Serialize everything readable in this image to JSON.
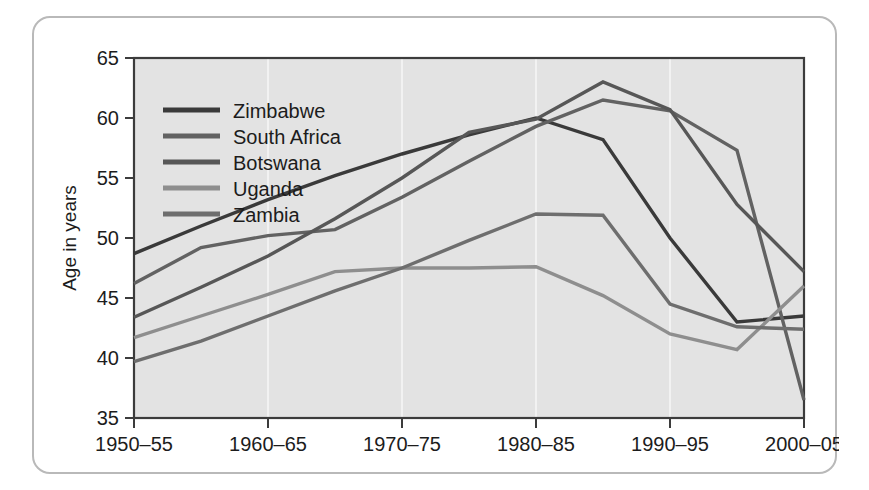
{
  "chart_data": {
    "type": "line",
    "title": "",
    "xlabel": "",
    "ylabel": "Age in years",
    "categories": [
      "1950–55",
      "1955–60",
      "1960–65",
      "1965–70",
      "1970–75",
      "1975–80",
      "1980–85",
      "1985–90",
      "1990–95",
      "1995–2000",
      "2000–05"
    ],
    "tick_labels_x": [
      "1950–55",
      "1960–65",
      "1970–75",
      "1980–85",
      "1990–95",
      "2000–05"
    ],
    "tick_labels_y": [
      "35",
      "40",
      "45",
      "50",
      "55",
      "60",
      "65"
    ],
    "ylim": [
      35,
      65
    ],
    "yticks": [
      35,
      40,
      45,
      50,
      55,
      60,
      65
    ],
    "grid": true,
    "grid_axis": "x",
    "legend_position": "top-left",
    "plot_background": "#e3e3e3",
    "series": [
      {
        "name": "Zimbabwe",
        "color": "#3a3a3a",
        "values": [
          48.7,
          51.0,
          53.2,
          55.2,
          57.0,
          58.6,
          60.0,
          58.2,
          50.0,
          43.0,
          43.5
        ]
      },
      {
        "name": "South Africa",
        "color": "#626262",
        "values": [
          46.2,
          49.2,
          50.2,
          50.7,
          53.4,
          56.4,
          59.3,
          61.5,
          60.6,
          57.3,
          36.5
        ]
      },
      {
        "name": "Botswana",
        "color": "#575757",
        "values": [
          43.4,
          45.9,
          48.5,
          51.6,
          55.0,
          58.8,
          59.9,
          63.0,
          60.7,
          52.8,
          47.2
        ]
      },
      {
        "name": "Uganda",
        "color": "#8e8e8e",
        "values": [
          41.7,
          43.5,
          45.3,
          47.2,
          47.5,
          47.5,
          47.6,
          45.2,
          42.0,
          40.7,
          46.0
        ]
      },
      {
        "name": "Zambia",
        "color": "#6e6e6e",
        "values": [
          39.7,
          41.4,
          43.5,
          45.6,
          47.5,
          49.8,
          52.0,
          51.9,
          44.5,
          42.6,
          42.4
        ]
      }
    ]
  },
  "legend": {
    "items": [
      {
        "label": "Zimbabwe"
      },
      {
        "label": "South Africa"
      },
      {
        "label": "Botswana"
      },
      {
        "label": "Uganda"
      },
      {
        "label": "Zambia"
      }
    ]
  },
  "axes": {
    "y_title": "Age in years"
  }
}
